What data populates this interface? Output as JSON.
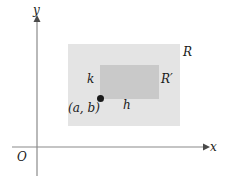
{
  "figure": {
    "type": "coordinate-plane-diagram",
    "background_color": "#ffffff",
    "axes": {
      "x_axis_label": "x",
      "y_axis_label": "y",
      "origin_label": "O",
      "axis_color": "#808080"
    },
    "regions": [
      {
        "name": "outer-rectangle",
        "label": "R",
        "fill_color": "#e4e4e4",
        "x": 68,
        "y": 44,
        "width": 112,
        "height": 82
      },
      {
        "name": "inner-rectangle",
        "label": "R′",
        "fill_color": "#c9c9c9",
        "x": 100,
        "y": 65,
        "width": 59,
        "height": 34
      }
    ],
    "point": {
      "label": "(a, b)",
      "color": "#1a1a1a",
      "x": 100,
      "y": 98
    },
    "dimension_labels": {
      "width_label": "h",
      "height_label": "k"
    }
  }
}
